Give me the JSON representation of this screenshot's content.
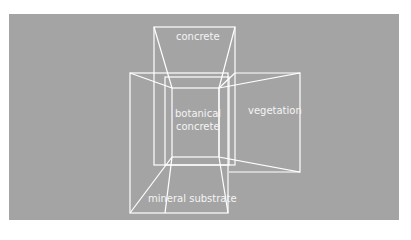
{
  "diagram": {
    "background_color": "#a4a4a4",
    "line_color": "#ffffff",
    "labels": {
      "top": "concrete",
      "center_line1": "botanical",
      "center_line2": "concrete",
      "right": "vegetation",
      "bottom": "mineral substrate"
    },
    "faces": [
      {
        "name": "concrete",
        "position": "top"
      },
      {
        "name": "botanical concrete",
        "position": "center"
      },
      {
        "name": "vegetation",
        "position": "right"
      },
      {
        "name": "mineral substrate",
        "position": "bottom"
      }
    ]
  }
}
